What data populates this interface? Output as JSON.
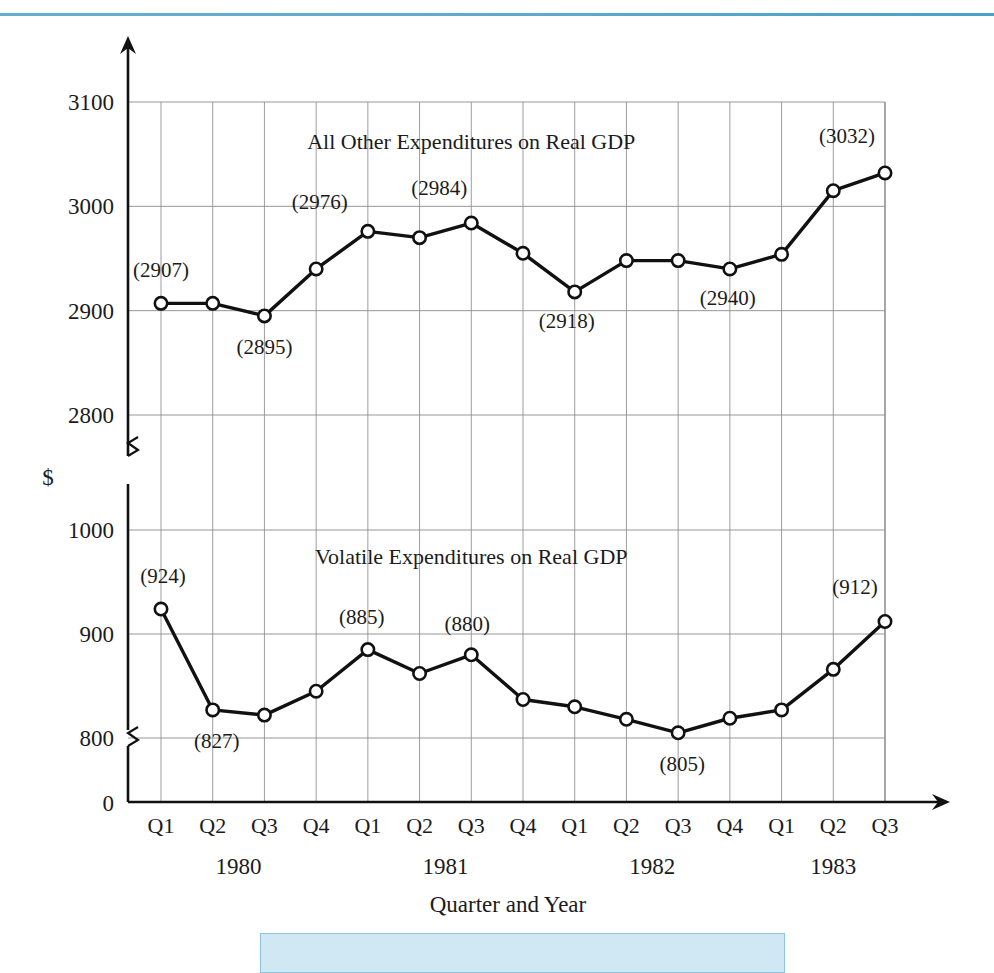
{
  "figure": {
    "y_unit_symbol": "$",
    "x_axis_title": "Quarter and Year",
    "accent_rule_color": "#4fa3ca",
    "caption_box_color": "#cfe8f3",
    "line_color": "#111111",
    "grid_color": "#8d8d8d",
    "marker_fill": "#ffffff"
  },
  "chart_data": {
    "type": "line",
    "title": "",
    "xlabel": "Quarter and Year",
    "ylabel": "$",
    "grid": true,
    "legend_position": "inline-annotation",
    "axis_break": true,
    "y_upper_ticks": [
      2800,
      2900,
      3000,
      3100
    ],
    "y_lower_ticks": [
      0,
      800,
      900,
      1000
    ],
    "y_upper_range": [
      2750,
      3140
    ],
    "y_lower_range": [
      0,
      1040
    ],
    "x": [
      "Q1 1980",
      "Q2 1980",
      "Q3 1980",
      "Q4 1980",
      "Q1 1981",
      "Q2 1981",
      "Q3 1981",
      "Q4 1981",
      "Q1 1982",
      "Q2 1982",
      "Q3 1982",
      "Q4 1982",
      "Q1 1983",
      "Q2 1983",
      "Q3 1983"
    ],
    "quarters": [
      "Q1",
      "Q2",
      "Q3",
      "Q4",
      "Q1",
      "Q2",
      "Q3",
      "Q4",
      "Q1",
      "Q2",
      "Q3",
      "Q4",
      "Q1",
      "Q2",
      "Q3"
    ],
    "years": [
      {
        "label": "1980",
        "start_index": 0,
        "end_index": 3
      },
      {
        "label": "1981",
        "start_index": 4,
        "end_index": 7
      },
      {
        "label": "1982",
        "start_index": 8,
        "end_index": 11
      },
      {
        "label": "1983",
        "start_index": 12,
        "end_index": 14
      }
    ],
    "series": [
      {
        "name": "All Other Expenditures on Real GDP",
        "panel": "upper",
        "values": [
          2907,
          2907,
          2895,
          2940,
          2976,
          2970,
          2984,
          2955,
          2918,
          2948,
          2948,
          2940,
          2954,
          3015,
          3032
        ],
        "labeled_points": [
          {
            "index": 0,
            "text": "(2907)",
            "dx": 0,
            "dy": -26
          },
          {
            "index": 2,
            "text": "(2895)",
            "dx": 0,
            "dy": 38
          },
          {
            "index": 4,
            "text": "(2976)",
            "dx": -48,
            "dy": -22
          },
          {
            "index": 6,
            "text": "(2984)",
            "dx": -32,
            "dy": -28
          },
          {
            "index": 8,
            "text": "(2918)",
            "dx": -8,
            "dy": 36
          },
          {
            "index": 11,
            "text": "(2940)",
            "dx": -2,
            "dy": 36
          },
          {
            "index": 14,
            "text": "(3032)",
            "dx": -38,
            "dy": -30
          }
        ]
      },
      {
        "name": "Volatile Expenditures on Real GDP",
        "panel": "lower",
        "values": [
          924,
          827,
          822,
          845,
          885,
          862,
          880,
          837,
          830,
          818,
          805,
          819,
          827,
          866,
          912
        ],
        "labeled_points": [
          {
            "index": 0,
            "text": "(924)",
            "dx": 2,
            "dy": -26
          },
          {
            "index": 1,
            "text": "(827)",
            "dx": 4,
            "dy": 38
          },
          {
            "index": 4,
            "text": "(885)",
            "dx": -6,
            "dy": -26
          },
          {
            "index": 6,
            "text": "(880)",
            "dx": -4,
            "dy": -24
          },
          {
            "index": 10,
            "text": "(805)",
            "dx": 4,
            "dy": 38
          },
          {
            "index": 14,
            "text": "(912)",
            "dx": -30,
            "dy": -28
          }
        ]
      }
    ],
    "annotations": [
      {
        "text": "All Other Expenditures on Real GDP",
        "x_index": 6.0,
        "panel": "upper",
        "y_value": 3055
      },
      {
        "text": "Volatile Expenditures on Real GDP",
        "x_index": 6.0,
        "panel": "lower",
        "y_value": 967
      }
    ]
  }
}
